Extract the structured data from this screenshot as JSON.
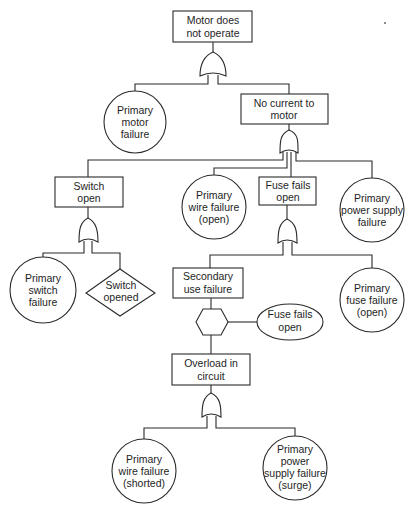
{
  "diagram": {
    "type": "fault-tree",
    "top_event": {
      "lines": [
        "Motor does",
        "not operate"
      ]
    },
    "nodes": {
      "primary_motor_failure": {
        "kind": "basic-event",
        "lines": [
          "Primary",
          "motor",
          "failure"
        ]
      },
      "no_current_to_motor": {
        "kind": "intermediate-event",
        "lines": [
          "No current  to",
          "motor"
        ]
      },
      "switch_open": {
        "kind": "intermediate-event",
        "lines": [
          "Switch",
          "open"
        ]
      },
      "primary_wire_failure_open": {
        "kind": "basic-event",
        "lines": [
          "Primary",
          "wire failure",
          "(open)"
        ]
      },
      "fuse_fails_open": {
        "kind": "intermediate-event",
        "lines": [
          "Fuse fails",
          "open"
        ]
      },
      "primary_power_supply_failure": {
        "kind": "basic-event",
        "lines": [
          "Primary",
          "power supply",
          "failure"
        ]
      },
      "primary_switch_failure": {
        "kind": "basic-event",
        "lines": [
          "Primary",
          "switch",
          "failure"
        ]
      },
      "switch_opened": {
        "kind": "undeveloped-event",
        "lines": [
          "Switch",
          "opened"
        ]
      },
      "secondary_use_failure": {
        "kind": "intermediate-event",
        "lines": [
          "Secondary",
          "use failure"
        ]
      },
      "primary_fuse_failure_open": {
        "kind": "basic-event",
        "lines": [
          "Primary",
          "fuse failure",
          "(open)"
        ]
      },
      "inhibit_condition": {
        "kind": "conditioning-event",
        "lines": [
          "Fuse fails",
          "open"
        ]
      },
      "overload_in_circuit": {
        "kind": "intermediate-event",
        "lines": [
          "Overload in",
          "circuit"
        ]
      },
      "primary_wire_failure_shorted": {
        "kind": "basic-event",
        "lines": [
          "Primary",
          "wire failure",
          "(shorted)"
        ]
      },
      "primary_power_supply_failure_surge": {
        "kind": "basic-event",
        "lines": [
          "Primary",
          "power",
          "supply failure",
          "(surge)"
        ]
      }
    },
    "gates": [
      "or-gate",
      "or-gate",
      "or-gate",
      "or-gate",
      "inhibit-gate",
      "or-gate"
    ],
    "colors": {
      "stroke": "#2a2a2a",
      "text": "#1e1e1e",
      "background": "#ffffff"
    }
  }
}
